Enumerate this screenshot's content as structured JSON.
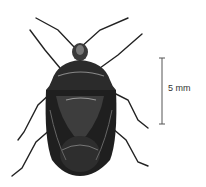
{
  "figure": {
    "scale_bar": {
      "label": "5 mm"
    }
  }
}
